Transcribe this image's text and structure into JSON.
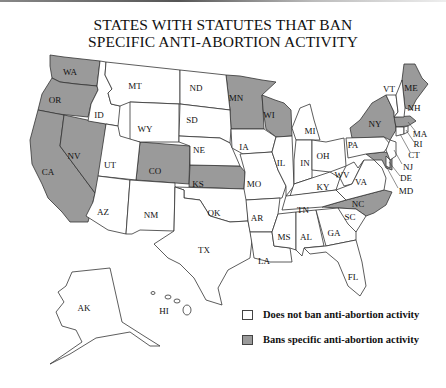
{
  "title": {
    "line1": "STATES WITH STATUTES THAT BAN",
    "line2": "SPECIFIC ANTI-ABORTION ACTIVITY"
  },
  "colors": {
    "ban": "#9a9a9a",
    "no_ban": "#ffffff",
    "border": "#333333"
  },
  "legend": {
    "no_ban_label": "Does not ban anti-abortion activity",
    "ban_label": "Bans specific anti-abortion activity"
  },
  "states_banning": [
    "WA",
    "OR",
    "CA",
    "NV",
    "CO",
    "KS",
    "MN",
    "WI",
    "NY",
    "MA",
    "ME",
    "MD",
    "NC"
  ],
  "labels": {
    "WA": "WA",
    "OR": "OR",
    "CA": "CA",
    "NV": "NV",
    "ID": "ID",
    "MT": "MT",
    "WY": "WY",
    "UT": "UT",
    "AZ": "AZ",
    "CO": "CO",
    "NM": "NM",
    "ND": "ND",
    "SD": "SD",
    "NE": "NE",
    "KS": "KS",
    "OK": "OK",
    "TX": "TX",
    "MN": "MN",
    "IA": "IA",
    "MO": "MO",
    "AR": "AR",
    "LA": "LA",
    "WI": "WI",
    "IL": "IL",
    "MS": "MS",
    "MI": "MI",
    "IN": "IN",
    "KY": "KY",
    "TN": "TN",
    "AL": "AL",
    "OH": "OH",
    "GA": "GA",
    "FL": "FL",
    "WV": "WV",
    "VA": "VA",
    "NC": "NC",
    "SC": "SC",
    "PA": "PA",
    "NY": "NY",
    "VT": "VT",
    "NH": "NH",
    "ME": "ME",
    "MA": "MA",
    "RI": "RI",
    "CT": "CT",
    "NJ": "NJ",
    "DE": "DE",
    "MD": "MD",
    "AK": "AK",
    "HI": "HI"
  }
}
